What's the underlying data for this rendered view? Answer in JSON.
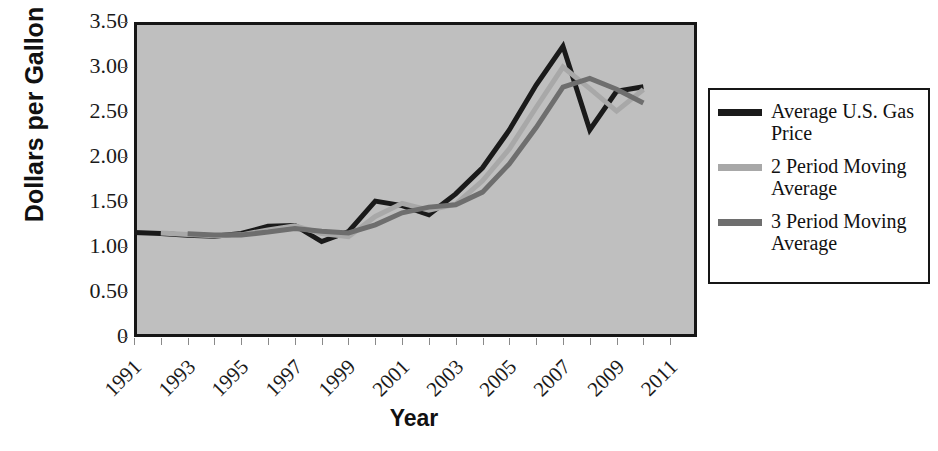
{
  "chart_data": {
    "type": "line",
    "title": "",
    "xlabel": "Year",
    "ylabel": "Dollars per Gallon",
    "grid": false,
    "legend_position": "right",
    "xlim": [
      1991,
      2012
    ],
    "ylim": [
      0,
      3.5
    ],
    "ytick_labels": [
      "3.50",
      "3.00",
      "2.50",
      "2.00",
      "1.50",
      "1.00",
      "0.50",
      "0"
    ],
    "ytick_values": [
      3.5,
      3.0,
      2.5,
      2.0,
      1.5,
      1.0,
      0.5,
      0
    ],
    "xtick_labels": [
      "1991",
      "1993",
      "1995",
      "1997",
      "1999",
      "2001",
      "2003",
      "2005",
      "2007",
      "2009",
      "2011"
    ],
    "xtick_values": [
      1991,
      1993,
      1995,
      1997,
      1999,
      2001,
      2003,
      2005,
      2007,
      2009,
      2011
    ],
    "x": [
      1991,
      1992,
      1993,
      1994,
      1995,
      1996,
      1997,
      1998,
      1999,
      2000,
      2001,
      2002,
      2003,
      2004,
      2005,
      2006,
      2007,
      2008,
      2009,
      2010,
      2011
    ],
    "series": [
      {
        "name": "Average U.S. Gas Price",
        "color": "#1a1a1a",
        "width": 5,
        "x": [
          1991,
          1992,
          1993,
          1994,
          1995,
          1996,
          1997,
          1998,
          1999,
          2000,
          2001,
          2002,
          2003,
          2004,
          2005,
          2006,
          2007,
          2008,
          2009,
          2010
        ],
        "values": [
          1.16,
          1.15,
          1.13,
          1.12,
          1.15,
          1.23,
          1.24,
          1.06,
          1.17,
          1.51,
          1.46,
          1.36,
          1.59,
          1.88,
          2.3,
          2.8,
          3.23,
          2.3,
          2.73,
          2.78
        ]
      },
      {
        "name": "2 Period Moving Average",
        "color": "#a8a8a8",
        "width": 5,
        "x": [
          1992,
          1993,
          1994,
          1995,
          1996,
          1997,
          1998,
          1999,
          2000,
          2001,
          2002,
          2003,
          2004,
          2005,
          2006,
          2007,
          2008,
          2009,
          2010
        ],
        "values": [
          1.155,
          1.14,
          1.125,
          1.135,
          1.19,
          1.235,
          1.15,
          1.115,
          1.34,
          1.485,
          1.41,
          1.475,
          1.735,
          2.09,
          2.55,
          3.0,
          2.76,
          2.51,
          2.75
        ]
      },
      {
        "name": "3 Period Moving Average",
        "color": "#6e6e6e",
        "width": 5,
        "x": [
          1993,
          1994,
          1995,
          1996,
          1997,
          1998,
          1999,
          2000,
          2001,
          2002,
          2003,
          2004,
          2005,
          2006,
          2007,
          2008,
          2009,
          2010
        ],
        "values": [
          1.146,
          1.133,
          1.133,
          1.166,
          1.206,
          1.176,
          1.156,
          1.246,
          1.38,
          1.443,
          1.47,
          1.61,
          1.923,
          2.327,
          2.777,
          2.873,
          2.753,
          2.6
        ]
      }
    ],
    "annotations": []
  },
  "legend": {
    "entries": [
      {
        "label": "Average U.S. Gas Price",
        "color": "#1a1a1a"
      },
      {
        "label": "2 Period Moving Average",
        "color": "#a8a8a8"
      },
      {
        "label": "3 Period Moving Average",
        "color": "#6e6e6e"
      }
    ]
  },
  "axes": {
    "y_title": "Dollars per Gallon",
    "x_title": "Year"
  },
  "colors": {
    "plot_background": "#bfbfbf",
    "plot_border": "#161616",
    "page_background": "#ffffff",
    "text": "#111111"
  }
}
